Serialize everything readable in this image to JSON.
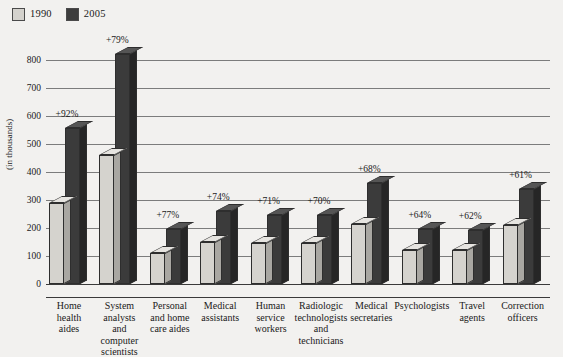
{
  "legend": {
    "items": [
      {
        "label": "1990",
        "color": "#d4d2cd",
        "name": "legend-1990"
      },
      {
        "label": "2005",
        "color": "#3d3d3d",
        "name": "legend-2005"
      }
    ]
  },
  "axis": {
    "y_title": "(in thousands)",
    "y_ticks": [
      "800",
      "700",
      "600",
      "500",
      "400",
      "300",
      "200",
      "100",
      "0"
    ]
  },
  "chart_data": {
    "type": "bar",
    "title": "",
    "xlabel": "",
    "ylabel": "(in thousands)",
    "ylim": [
      0,
      800
    ],
    "grid": true,
    "legend_position": "top-left",
    "categories": [
      "Home health aides",
      "System analysts and computer scientists",
      "Personal and home care aides",
      "Medical assistants",
      "Human service workers",
      "Radiologic technologists and technicians",
      "Medical secretaries",
      "Psychologists",
      "Travel agents",
      "Correction officers"
    ],
    "category_lines": [
      [
        "Home",
        "health",
        "aides"
      ],
      [
        "System",
        "analysts",
        "and",
        "computer",
        "scientists"
      ],
      [
        "Personal",
        "and home",
        "care aides"
      ],
      [
        "Medical",
        "assistants"
      ],
      [
        "Human",
        "service",
        "workers"
      ],
      [
        "Radiologic",
        "technologists",
        "and",
        "technicians"
      ],
      [
        "Medical",
        "secretaries"
      ],
      [
        "Psychologists"
      ],
      [
        "Travel",
        "agents"
      ],
      [
        "Correction",
        "officers"
      ]
    ],
    "series": [
      {
        "name": "1990",
        "color": "#d4d2cd",
        "values": [
          290,
          460,
          110,
          150,
          145,
          145,
          215,
          120,
          120,
          210
        ]
      },
      {
        "name": "2005",
        "color": "#3d3d3d",
        "values": [
          557,
          823,
          195,
          261,
          248,
          247,
          361,
          197,
          194,
          338
        ]
      }
    ],
    "annotations": [
      "+92%",
      "+79%",
      "+77%",
      "+74%",
      "+71%",
      "+70%",
      "+68%",
      "+64%",
      "+62%",
      "+61%"
    ]
  }
}
